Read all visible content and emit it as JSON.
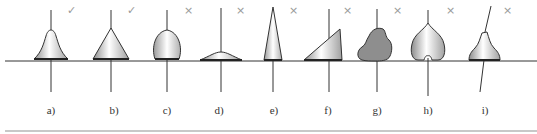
{
  "figure": {
    "baseline_color": "#333333",
    "fill_light": "#ffffff",
    "fill_dark": "#9a9a9a",
    "fill_gray": "#8f8f8f",
    "items": [
      {
        "label": "a)",
        "mark": "✓",
        "shape": "bell"
      },
      {
        "label": "b)",
        "mark": "✓",
        "shape": "cone"
      },
      {
        "label": "c)",
        "mark": "×",
        "shape": "dome"
      },
      {
        "label": "d)",
        "mark": "×",
        "shape": "flat-arc"
      },
      {
        "label": "e)",
        "mark": "×",
        "shape": "tall-spike"
      },
      {
        "label": "f)",
        "mark": "×",
        "shape": "right-triangle"
      },
      {
        "label": "g)",
        "mark": "×",
        "shape": "irregular-blob"
      },
      {
        "label": "h)",
        "mark": "×",
        "shape": "heart"
      },
      {
        "label": "i)",
        "mark": "×",
        "shape": "tilted-bell"
      }
    ]
  }
}
